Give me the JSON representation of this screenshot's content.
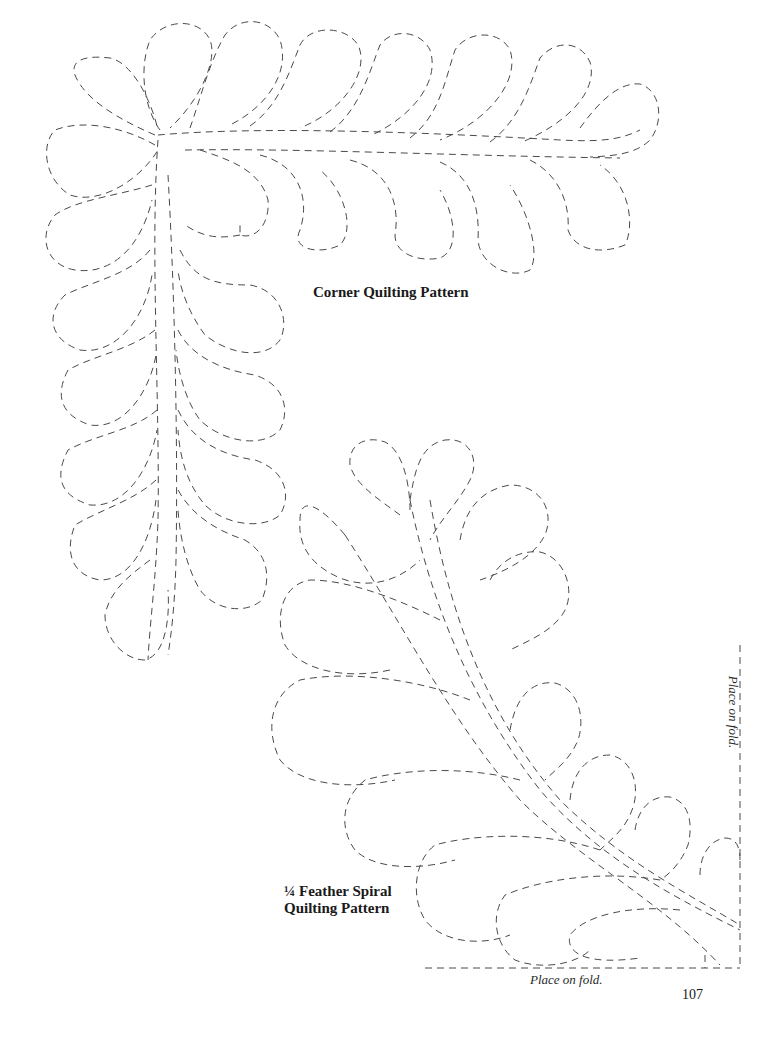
{
  "page": {
    "page_number": "107",
    "background_color": "#ffffff",
    "stitch_line_color": "#4a4a4a",
    "stitch_style": "dashed"
  },
  "corner_pattern": {
    "title": "Corner Quilting Pattern",
    "feather_icon": "feather-corner-icon"
  },
  "spiral_pattern": {
    "title_line_1": "¼ Feather Spiral",
    "title_line_2": "Quilting Pattern",
    "feather_icon": "feather-spiral-icon"
  },
  "fold_guides": {
    "bottom_label": "Place on fold.",
    "right_label": "Place on fold."
  }
}
